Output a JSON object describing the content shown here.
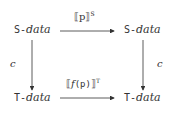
{
  "nodes": {
    "top_left": {
      "prefix": "S-",
      "suffix": "data"
    },
    "top_right": {
      "prefix": "S-",
      "suffix": "data"
    },
    "bottom_left": {
      "prefix": "T-",
      "suffix": "data"
    },
    "bottom_right": {
      "prefix": "T-",
      "suffix": "data"
    }
  },
  "edges": {
    "top": {
      "open": "⟦p⟧",
      "sup": "S"
    },
    "bottom": {
      "open": "⟦",
      "func": "f",
      "arg": "(p)",
      "close": "⟧",
      "sup": "T"
    },
    "left": {
      "label": "c"
    },
    "right": {
      "label": "c"
    }
  },
  "colors": {
    "ink": "#333333"
  }
}
